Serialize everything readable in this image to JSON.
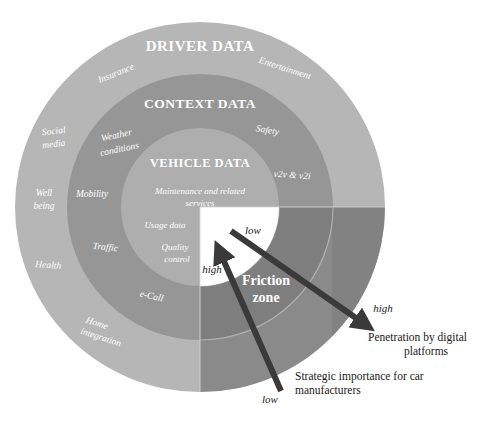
{
  "diagram": {
    "type": "concentric-rings-quadrant",
    "center": {
      "x": 200,
      "y": 207
    },
    "rings": [
      {
        "id": "driver-data",
        "title": "DRIVER DATA",
        "radius": 185,
        "color": "#b6b6b6",
        "title_pos": {
          "x": 200,
          "y": 51
        },
        "title_size": 15,
        "items": [
          {
            "label": "Insurance",
            "x": 117,
            "y": 76,
            "size": 9.5,
            "rotate": -22
          },
          {
            "label": "Entertainment",
            "x": 284,
            "y": 71,
            "size": 9.5,
            "rotate": 18
          },
          {
            "label": "Social",
            "x": 54,
            "y": 134,
            "size": 9.5,
            "rotate": -6
          },
          {
            "label": "media",
            "x": 54,
            "y": 147,
            "size": 9.5,
            "rotate": -6
          },
          {
            "label": "Well",
            "x": 44,
            "y": 196,
            "size": 9.5,
            "rotate": 0
          },
          {
            "label": "being",
            "x": 44,
            "y": 209,
            "size": 9.5,
            "rotate": 0
          },
          {
            "label": "Health",
            "x": 48,
            "y": 268,
            "size": 9.5,
            "rotate": 4
          },
          {
            "label": "Home",
            "x": 96,
            "y": 326,
            "size": 9.5,
            "rotate": 18
          },
          {
            "label": "integration",
            "x": 100,
            "y": 340,
            "size": 9.5,
            "rotate": 18
          }
        ]
      },
      {
        "id": "context-data",
        "title": "CONTEXT DATA",
        "radius": 133,
        "color": "#969696",
        "title_pos": {
          "x": 200,
          "y": 108
        },
        "title_size": 13.5,
        "items": [
          {
            "label": "Weather",
            "x": 117,
            "y": 138,
            "size": 9.5,
            "rotate": -12
          },
          {
            "label": "conditions",
            "x": 120,
            "y": 152,
            "size": 9.5,
            "rotate": -12
          },
          {
            "label": "Safety",
            "x": 267,
            "y": 133,
            "size": 9.5,
            "rotate": 10
          },
          {
            "label": "v2v & v2i",
            "x": 292,
            "y": 178,
            "size": 9.5,
            "rotate": 4
          },
          {
            "label": "Mobility",
            "x": 92,
            "y": 197,
            "size": 9.5,
            "rotate": 0
          },
          {
            "label": "Traffic",
            "x": 105,
            "y": 250,
            "size": 9.5,
            "rotate": 6
          },
          {
            "label": "e-Call",
            "x": 151,
            "y": 299,
            "size": 9.5,
            "rotate": 12
          }
        ]
      },
      {
        "id": "vehicle-data",
        "title": "VEHICLE DATA",
        "radius": 79,
        "color": "#aeaeae",
        "title_pos": {
          "x": 200,
          "y": 167
        },
        "title_size": 12.5,
        "items": [
          {
            "label": "Maintenance and related",
            "x": 200,
            "y": 194,
            "size": 9,
            "rotate": 0
          },
          {
            "label": "services",
            "x": 200,
            "y": 206,
            "size": 9,
            "rotate": 0
          },
          {
            "label": "Usage data",
            "x": 165,
            "y": 228,
            "size": 9,
            "rotate": 0
          },
          {
            "label": "Quality",
            "x": 175,
            "y": 250,
            "size": 9,
            "rotate": 0
          },
          {
            "label": "control",
            "x": 177,
            "y": 262,
            "size": 9,
            "rotate": 0
          }
        ]
      }
    ],
    "overlay": {
      "label": "Friction zone",
      "label_lines": [
        "Friction",
        "zone"
      ],
      "label_pos": {
        "x": 266,
        "y": 285
      },
      "label_size": 14,
      "shade_color": "#6f6f6f",
      "shade_color_light": "#787878",
      "white_quadrant_radius": 79,
      "white_color": "#ffffff"
    },
    "axis_labels": [
      {
        "name": "vertical-axis-low",
        "text": "low",
        "x": 253,
        "y": 234,
        "size": 11,
        "rotate": 0
      },
      {
        "name": "vertical-axis-high",
        "text": "high",
        "x": 212,
        "y": 273,
        "size": 11,
        "rotate": 0
      },
      {
        "name": "horizontal-axis-high",
        "text": "high",
        "x": 383,
        "y": 312,
        "size": 11,
        "rotate": 0
      },
      {
        "name": "horizontal-axis-low",
        "text": "low",
        "x": 270,
        "y": 403,
        "size": 11,
        "rotate": 0
      }
    ],
    "arrows": [
      {
        "name": "penetration-arrow",
        "from": {
          "x": 231,
          "y": 231
        },
        "to": {
          "x": 372,
          "y": 330
        },
        "color": "#3a3a3a",
        "width": 6
      },
      {
        "name": "strategic-importance-arrow",
        "from": {
          "x": 281,
          "y": 391
        },
        "to": {
          "x": 217,
          "y": 245
        },
        "color": "#3a3a3a",
        "width": 6
      }
    ],
    "legends": [
      {
        "name": "penetration-legend",
        "lines": [
          "Penetration by digital",
          "platforms"
        ],
        "x": 368,
        "y": 340,
        "size": 11.5,
        "align": "start"
      },
      {
        "name": "strategic-importance-legend",
        "lines": [
          "Strategic importance for car",
          "manufacturers"
        ],
        "x": 295,
        "y": 379,
        "size": 11.5,
        "align": "start"
      }
    ],
    "colors": {
      "outer_ring": "#b6b6b6",
      "middle_ring": "#969696",
      "inner_circle": "#aeaeae",
      "friction_shade": "#6f6f6f",
      "arrow": "#3a3a3a",
      "text_dark": "#1a1a1a",
      "text_light": "#ffffff",
      "background": "#ffffff"
    }
  }
}
